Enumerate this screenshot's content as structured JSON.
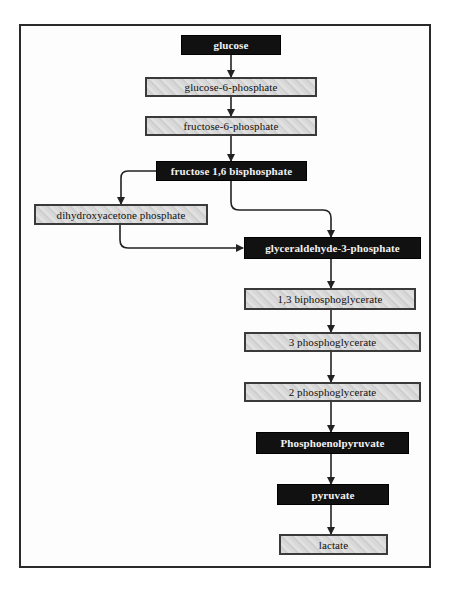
{
  "diagram": {
    "title": "",
    "type": "flowchart",
    "nodes": [
      {
        "id": "glucose",
        "label": "glucose",
        "style": "dark"
      },
      {
        "id": "g6p",
        "label": "glucose-6-phosphate",
        "style": "light"
      },
      {
        "id": "f6p",
        "label": "fructose-6-phosphate",
        "style": "light"
      },
      {
        "id": "f16bp",
        "label": "fructose 1,6 bisphosphate",
        "style": "dark"
      },
      {
        "id": "dhap",
        "label": "dihydroxyacetone phosphate",
        "style": "light"
      },
      {
        "id": "g3p",
        "label": "glyceraldehyde-3-phosphate",
        "style": "dark"
      },
      {
        "id": "bpg13",
        "label": "1,3 biphosphoglycerate",
        "style": "light"
      },
      {
        "id": "pg3",
        "label": "3 phosphoglycerate",
        "style": "light"
      },
      {
        "id": "pg2",
        "label": "2 phosphoglycerate",
        "style": "light"
      },
      {
        "id": "pep",
        "label": "Phosphoenolpyruvate",
        "style": "dark"
      },
      {
        "id": "pyruvate",
        "label": "pyruvate",
        "style": "dark"
      },
      {
        "id": "lactate",
        "label": "lactate",
        "style": "light"
      }
    ],
    "edges": [
      {
        "from": "glucose",
        "to": "g6p"
      },
      {
        "from": "g6p",
        "to": "f6p"
      },
      {
        "from": "f6p",
        "to": "f16bp"
      },
      {
        "from": "f16bp",
        "to": "dhap"
      },
      {
        "from": "f16bp",
        "to": "g3p"
      },
      {
        "from": "dhap",
        "to": "g3p"
      },
      {
        "from": "g3p",
        "to": "bpg13"
      },
      {
        "from": "bpg13",
        "to": "pg3"
      },
      {
        "from": "pg3",
        "to": "pg2"
      },
      {
        "from": "pg2",
        "to": "pep"
      },
      {
        "from": "pep",
        "to": "pyruvate"
      },
      {
        "from": "pyruvate",
        "to": "lactate"
      }
    ]
  },
  "colors": {
    "dark_node_bg": "#111111",
    "dark_node_text": "#f2f2f2",
    "light_node_bg": "#d6d6d6",
    "line": "#222222",
    "frame": "#2a2a2a"
  }
}
